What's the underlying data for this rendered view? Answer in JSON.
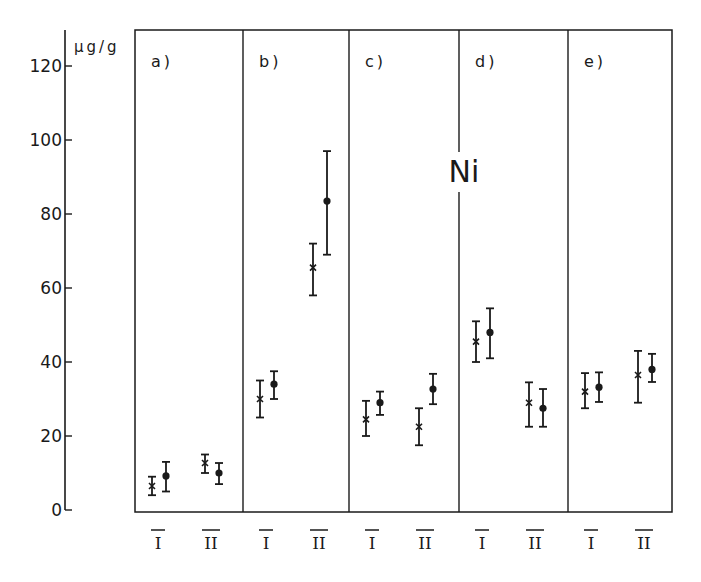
{
  "chart_data": {
    "type": "scatter",
    "title": "Ni",
    "xlabel": "",
    "ylabel": "μg/g",
    "ylim": [
      0,
      120
    ],
    "yticks": [
      0,
      20,
      40,
      60,
      80,
      100,
      120
    ],
    "grid": false,
    "panels": [
      "a)",
      "b)",
      "c)",
      "d)",
      "e)"
    ],
    "groups": [
      "I",
      "II"
    ],
    "markers": {
      "cross": "x (series 1)",
      "dot": "● (series 2)"
    },
    "series": [
      {
        "name": "cross",
        "marker": "x",
        "points": [
          {
            "panel": "a)",
            "group": "I",
            "value": 6.5,
            "low": 4,
            "high": 9
          },
          {
            "panel": "a)",
            "group": "II",
            "value": 12.7,
            "low": 10,
            "high": 15
          },
          {
            "panel": "b)",
            "group": "I",
            "value": 30,
            "low": 25,
            "high": 35
          },
          {
            "panel": "b)",
            "group": "II",
            "value": 65.5,
            "low": 58,
            "high": 72
          },
          {
            "panel": "c)",
            "group": "I",
            "value": 24.5,
            "low": 20,
            "high": 29.5
          },
          {
            "panel": "c)",
            "group": "II",
            "value": 22.5,
            "low": 17.5,
            "high": 27.5
          },
          {
            "panel": "d)",
            "group": "I",
            "value": 45.5,
            "low": 40,
            "high": 51
          },
          {
            "panel": "d)",
            "group": "II",
            "value": 29,
            "low": 22.5,
            "high": 34.5
          },
          {
            "panel": "e)",
            "group": "I",
            "value": 32,
            "low": 27.5,
            "high": 37
          },
          {
            "panel": "e)",
            "group": "II",
            "value": 36.5,
            "low": 29,
            "high": 43
          }
        ]
      },
      {
        "name": "dot",
        "marker": "filled-circle",
        "points": [
          {
            "panel": "a)",
            "group": "I",
            "value": 9.2,
            "low": 5,
            "high": 13
          },
          {
            "panel": "a)",
            "group": "II",
            "value": 10,
            "low": 7,
            "high": 12.7
          },
          {
            "panel": "b)",
            "group": "I",
            "value": 34,
            "low": 30,
            "high": 37.5
          },
          {
            "panel": "b)",
            "group": "II",
            "value": 83.5,
            "low": 69,
            "high": 97
          },
          {
            "panel": "c)",
            "group": "I",
            "value": 29,
            "low": 25.7,
            "high": 32
          },
          {
            "panel": "c)",
            "group": "II",
            "value": 32.7,
            "low": 28.6,
            "high": 36.8
          },
          {
            "panel": "d)",
            "group": "I",
            "value": 48,
            "low": 41,
            "high": 54.5
          },
          {
            "panel": "d)",
            "group": "II",
            "value": 27.5,
            "low": 22.5,
            "high": 32.7
          },
          {
            "panel": "e)",
            "group": "I",
            "value": 33.2,
            "low": 29.2,
            "high": 37.2
          },
          {
            "panel": "e)",
            "group": "II",
            "value": 38,
            "low": 34.6,
            "high": 42.2
          }
        ]
      }
    ],
    "annotations": [
      "Ni"
    ]
  },
  "axis": {
    "unit_label": "μg/g",
    "ticks": [
      "0",
      "20",
      "40",
      "60",
      "80",
      "100",
      "120"
    ]
  },
  "panels": [
    {
      "label": "a)"
    },
    {
      "label": "b)"
    },
    {
      "label": "c)"
    },
    {
      "label": "d)"
    },
    {
      "label": "e)"
    }
  ],
  "element_label": "Ni",
  "group_labels": [
    "I",
    "II"
  ],
  "colors": {
    "ink": "#1a1a1a",
    "background": "#ffffff"
  }
}
